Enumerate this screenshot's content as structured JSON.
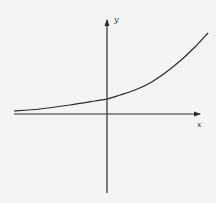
{
  "chart_data": {
    "type": "line",
    "title": "",
    "xlabel": "x",
    "ylabel": "y",
    "grid": false,
    "ticks": false,
    "legend": null,
    "series": [
      {
        "name": "y = a·e^(bx)",
        "pixel_points": [
          [
            14,
            111
          ],
          [
            40,
            109
          ],
          [
            70,
            105
          ],
          [
            95,
            101
          ],
          [
            107,
            99
          ],
          [
            120,
            95
          ],
          [
            135,
            90
          ],
          [
            150,
            83
          ],
          [
            165,
            73
          ],
          [
            180,
            61
          ],
          [
            195,
            47
          ],
          [
            208,
            33
          ]
        ]
      }
    ],
    "axes": {
      "origin_px": [
        107,
        114
      ],
      "x_axis": {
        "from": [
          14,
          114
        ],
        "to": [
          200,
          114
        ]
      },
      "y_axis": {
        "from": [
          107,
          193
        ],
        "to": [
          107,
          20
        ]
      }
    },
    "colors": {
      "background": "#f4f4f2",
      "ink": "#2a2a2a"
    }
  },
  "labels": {
    "x_axis": "x",
    "y_axis": "y"
  }
}
